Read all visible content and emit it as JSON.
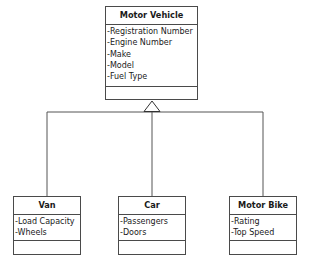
{
  "diagram": {
    "type": "uml-class-inheritance",
    "parent": {
      "name": "Motor Vehicle",
      "attributes": [
        "-Registration Number",
        "-Engine Number",
        "-Make",
        "-Model",
        "-Fuel Type"
      ],
      "operations": []
    },
    "children": [
      {
        "name": "Van",
        "attributes": [
          "-Load Capacity",
          "-Wheels"
        ],
        "operations": []
      },
      {
        "name": "Car",
        "attributes": [
          "-Passengers",
          "-Doors"
        ],
        "operations": []
      },
      {
        "name": "Motor Bike",
        "attributes": [
          "-Rating",
          "-Top Speed"
        ],
        "operations": []
      }
    ],
    "relationship": "generalization",
    "line_color": "#4a4a4a"
  }
}
